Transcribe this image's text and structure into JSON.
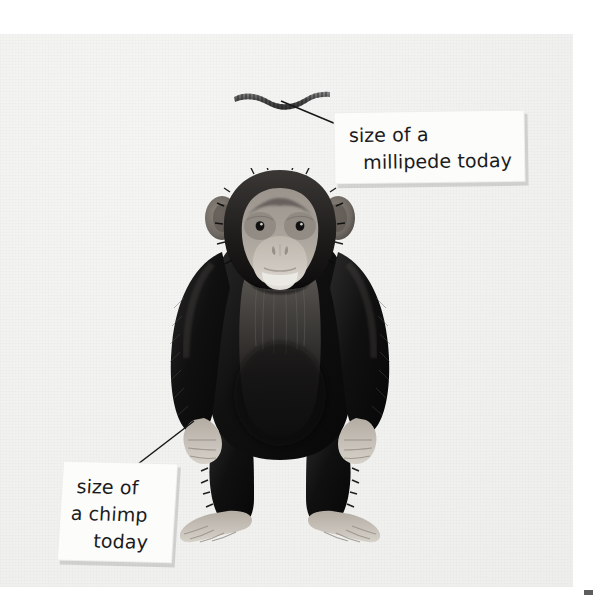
{
  "page": {
    "background_color": "#ffffff",
    "paper_color": "#f1f1f0",
    "ink_color": "#1b1b1b"
  },
  "illustration": {
    "subject_primary": "chimpanzee",
    "subject_secondary": "millipede",
    "style": "greyscale photographic collage on textured paper"
  },
  "callouts": [
    {
      "id": "millipede",
      "lines": [
        "size of a",
        "millipede today"
      ],
      "full_text": "size of a millipede today",
      "points_to": "millipede"
    },
    {
      "id": "chimp",
      "lines": [
        "size of",
        "a chimp",
        "today"
      ],
      "full_text": "size of a chimp today",
      "points_to": "chimp-hand"
    }
  ]
}
